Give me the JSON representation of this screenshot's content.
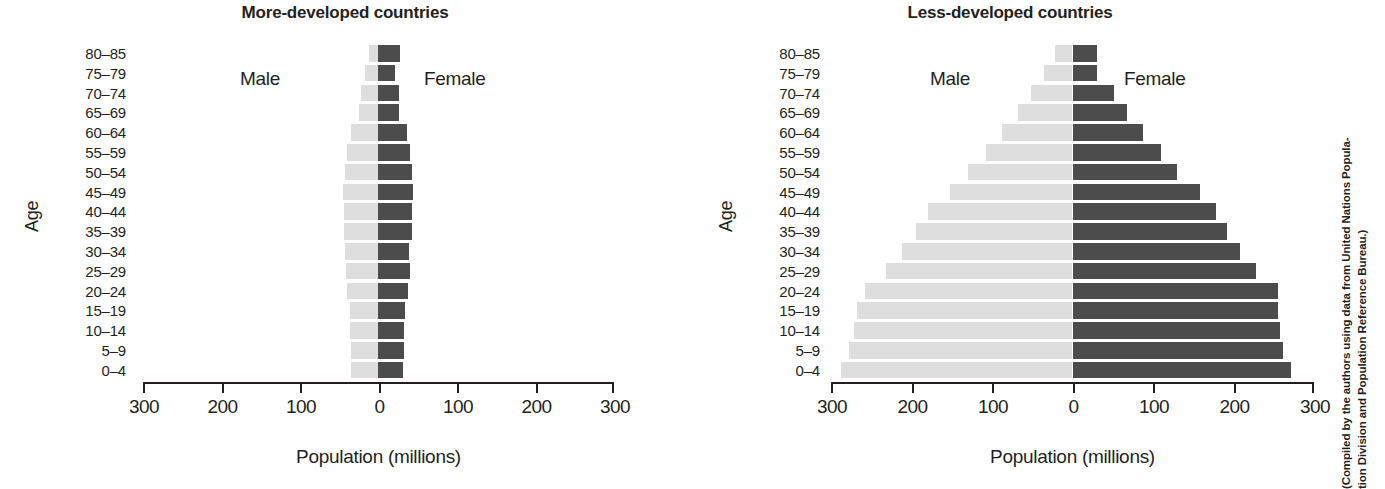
{
  "figure": {
    "credit_line_1": "(Compiled by the authors using data from United Nations Popula-",
    "credit_line_2": "tion Division and Population Reference Bureau.)"
  },
  "panels": [
    {
      "id": "more-developed",
      "title": "More-developed countries",
      "male_label": "Male",
      "female_label": "Female"
    },
    {
      "id": "less-developed",
      "title": "Less-developed countries",
      "male_label": "Male",
      "female_label": "Female"
    }
  ],
  "axis": {
    "y_title": "Age",
    "x_title": "Population (millions)",
    "x_ticks": [
      "300",
      "200",
      "100",
      "0",
      "100",
      "200",
      "300"
    ]
  },
  "chart_data": [
    {
      "type": "bar",
      "subtype": "population-pyramid",
      "title": "More-developed countries",
      "xlabel": "Population (millions)",
      "ylabel": "Age",
      "xlim": [
        -300,
        300
      ],
      "xticks": [
        -300,
        -200,
        -100,
        0,
        100,
        200,
        300
      ],
      "xticklabels": [
        "300",
        "200",
        "100",
        "0",
        "100",
        "200",
        "300"
      ],
      "grid": false,
      "legend": "inline-labels",
      "categories": [
        "80–85",
        "75–79",
        "70–74",
        "65–69",
        "60–64",
        "55–59",
        "50–54",
        "45–49",
        "40–44",
        "35–39",
        "30–34",
        "25–29",
        "20–24",
        "15–19",
        "10–14",
        "5–9",
        "0–4"
      ],
      "series": [
        {
          "name": "Male",
          "color": "#dedede",
          "direction": "left",
          "values": [
            12,
            17,
            22,
            24,
            34,
            39,
            42,
            45,
            44,
            43,
            42,
            41,
            39,
            36,
            36,
            35,
            34
          ]
        },
        {
          "name": "Female",
          "color": "#4c4c4c",
          "direction": "right",
          "values": [
            28,
            22,
            27,
            27,
            37,
            41,
            43,
            45,
            44,
            43,
            40,
            41,
            38,
            35,
            33,
            33,
            32
          ]
        }
      ]
    },
    {
      "type": "bar",
      "subtype": "population-pyramid",
      "title": "Less-developed countries",
      "xlabel": "Population (millions)",
      "ylabel": "Age",
      "xlim": [
        -300,
        300
      ],
      "xticks": [
        -300,
        -200,
        -100,
        0,
        100,
        200,
        300
      ],
      "xticklabels": [
        "300",
        "200",
        "100",
        "0",
        "100",
        "200",
        "300"
      ],
      "grid": false,
      "legend": "inline-labels",
      "categories": [
        "80–85",
        "75–79",
        "70–74",
        "65–69",
        "60–64",
        "55–59",
        "50–54",
        "45–49",
        "40–44",
        "35–39",
        "30–34",
        "25–29",
        "20–24",
        "15–19",
        "10–14",
        "5–9",
        "0–4"
      ],
      "series": [
        {
          "name": "Male",
          "color": "#dedede",
          "direction": "left",
          "values": [
            22,
            36,
            52,
            68,
            88,
            107,
            130,
            152,
            180,
            195,
            212,
            232,
            258,
            268,
            272,
            278,
            288
          ]
        },
        {
          "name": "Female",
          "color": "#4c4c4c",
          "direction": "right",
          "values": [
            30,
            30,
            52,
            68,
            88,
            110,
            130,
            158,
            178,
            192,
            208,
            228,
            255,
            255,
            258,
            262,
            272
          ]
        }
      ]
    }
  ]
}
